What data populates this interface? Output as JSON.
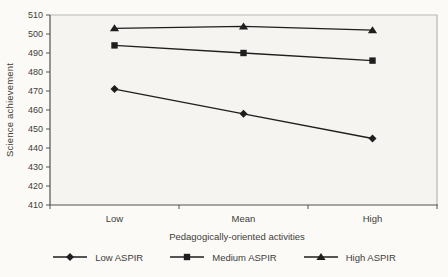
{
  "chart_data": {
    "type": "line",
    "title": "",
    "categories": [
      "Low",
      "Mean",
      "High"
    ],
    "series": [
      {
        "name": "Low ASPIR",
        "marker": "diamond",
        "values": [
          471,
          458,
          445
        ]
      },
      {
        "name": "Medium ASPIR",
        "marker": "square",
        "values": [
          494,
          490,
          486
        ]
      },
      {
        "name": "High ASPIR",
        "marker": "triangle",
        "values": [
          503,
          504,
          502
        ]
      }
    ],
    "xlabel": "Pedagogically-oriented activities",
    "ylabel": "Science achievement",
    "ylim": [
      410,
      510
    ],
    "ytick_step": 10,
    "grid": false,
    "legend_position": "bottom",
    "colors": {
      "line": "#1e1e1e",
      "marker": "#1e1e1e",
      "axis": "#55524d",
      "plot_border": "#b9b7b2",
      "plot_background": "#f5f4f0",
      "text": "#3f3d39"
    }
  }
}
